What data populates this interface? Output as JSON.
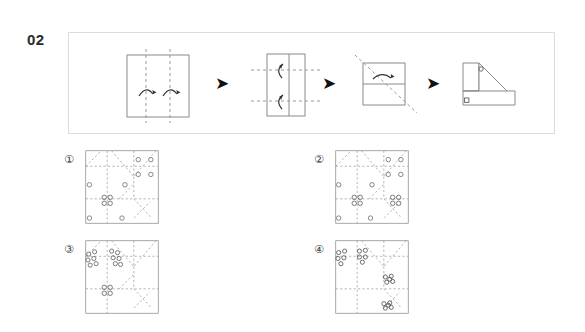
{
  "question": {
    "number": "02",
    "type": "paper-folding-punch-puzzle"
  },
  "sequence": {
    "steps": [
      {
        "index": 1,
        "name": "flat-square-two-vertical-folds",
        "shape": "square",
        "fold_lines": [
          "vertical-left",
          "vertical-right"
        ],
        "fold_arrows": [
          "curved-up-left",
          "curved-up-right"
        ],
        "description": "Square sheet with two vertical dashed fold lines and upward curved arrows"
      },
      {
        "index": 2,
        "name": "narrow-rectangle-two-horizontal-folds",
        "shape": "vertical-rectangle",
        "fold_lines": [
          "horizontal-top",
          "horizontal-bottom"
        ],
        "fold_arrows": [
          "curved-left-top",
          "curved-left-bottom"
        ],
        "description": "Narrow vertical rectangle with two horizontal dashed fold lines and leftward curved arrows"
      },
      {
        "index": 3,
        "name": "square-diagonal-fold",
        "shape": "square-split-horizontally",
        "fold_lines": [
          "diagonal"
        ],
        "fold_arrows": [
          "curved-right"
        ],
        "description": "Small square with horizontal divider and a diagonal dashed fold line"
      },
      {
        "index": 4,
        "name": "final-folded-shape-with-punches",
        "shape": "triangle-with-notch",
        "punches": [
          "upper-small-circle",
          "lower-small-square"
        ],
        "description": "Final folded triangular shape showing two punch marks"
      }
    ],
    "arrows": [
      "arrow-1",
      "arrow-2",
      "arrow-3"
    ],
    "arrow_glyph": "➤"
  },
  "options": [
    {
      "label": "①",
      "name": "option-1",
      "holes": [
        {
          "x": 0.72,
          "y": 0.13,
          "type": "circle"
        },
        {
          "x": 0.89,
          "y": 0.13,
          "type": "circle"
        },
        {
          "x": 0.72,
          "y": 0.33,
          "type": "circle"
        },
        {
          "x": 0.89,
          "y": 0.33,
          "type": "circle"
        },
        {
          "x": 0.54,
          "y": 0.47,
          "type": "circle"
        },
        {
          "x": 0.06,
          "y": 0.47,
          "type": "circle"
        },
        {
          "x": 0.06,
          "y": 0.92,
          "type": "circle"
        },
        {
          "x": 0.5,
          "y": 0.92,
          "type": "circle"
        }
      ],
      "clusters": [
        {
          "x": 0.3,
          "y": 0.68,
          "type": "cluster4"
        }
      ]
    },
    {
      "label": "②",
      "name": "option-2",
      "holes": [
        {
          "x": 0.72,
          "y": 0.13,
          "type": "circle"
        },
        {
          "x": 0.89,
          "y": 0.13,
          "type": "circle"
        },
        {
          "x": 0.72,
          "y": 0.33,
          "type": "circle"
        },
        {
          "x": 0.89,
          "y": 0.33,
          "type": "circle"
        },
        {
          "x": 0.5,
          "y": 0.47,
          "type": "circle"
        },
        {
          "x": 0.05,
          "y": 0.47,
          "type": "circle"
        },
        {
          "x": 0.05,
          "y": 0.92,
          "type": "circle"
        },
        {
          "x": 0.48,
          "y": 0.92,
          "type": "circle"
        }
      ],
      "clusters": [
        {
          "x": 0.3,
          "y": 0.68,
          "type": "cluster4"
        },
        {
          "x": 0.82,
          "y": 0.68,
          "type": "cluster4"
        }
      ]
    },
    {
      "label": "③",
      "name": "option-3",
      "holes": [],
      "clusters": [
        {
          "x": 0.09,
          "y": 0.27,
          "type": "cluster-scatter"
        },
        {
          "x": 0.4,
          "y": 0.25,
          "type": "cluster-scatter"
        },
        {
          "x": 0.3,
          "y": 0.68,
          "type": "cluster4"
        }
      ]
    },
    {
      "label": "④",
      "name": "option-4",
      "holes": [],
      "clusters": [
        {
          "x": 0.09,
          "y": 0.23,
          "type": "cluster-scatter"
        },
        {
          "x": 0.35,
          "y": 0.22,
          "type": "cluster-scatter"
        },
        {
          "x": 0.72,
          "y": 0.53,
          "type": "cluster-scatter"
        },
        {
          "x": 0.7,
          "y": 0.88,
          "type": "cluster-scatter"
        }
      ]
    }
  ],
  "style": {
    "panel_border": "#dcdcdc",
    "figure_stroke": "#8a8a8a",
    "crease_stroke": "#9a9a9a",
    "hole_stroke": "#6f6f6f",
    "arrow_color": "#111111",
    "label_color": "#3a3a3a",
    "number_color": "#2b2b2b",
    "background": "#ffffff"
  }
}
